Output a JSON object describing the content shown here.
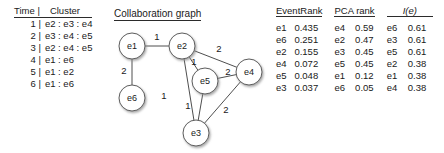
{
  "cluster_table": {
    "header_time": "Time |",
    "header_cluster": "Cluster",
    "rows": [
      {
        "time": "1 |",
        "members": "e2 : e3 : e4"
      },
      {
        "time": "2 |",
        "members": "e3 : e4 : e5"
      },
      {
        "time": "3 |",
        "members": "e2 : e4 : e5"
      },
      {
        "time": "4 |",
        "members": "e1 : e6"
      },
      {
        "time": "5 |",
        "members": "e1 : e2"
      },
      {
        "time": "6 |",
        "members": "e1 : e6"
      }
    ]
  },
  "graph": {
    "title": "Collaboration graph",
    "nodes": [
      {
        "id": "e1",
        "label": "e1",
        "x": 124,
        "y": 40,
        "r": 13
      },
      {
        "id": "e2",
        "label": "e2",
        "x": 174,
        "y": 40,
        "r": 13
      },
      {
        "id": "e6",
        "label": "e6",
        "x": 124,
        "y": 92,
        "r": 13
      },
      {
        "id": "e5",
        "label": "e5",
        "x": 197,
        "y": 75,
        "r": 13
      },
      {
        "id": "e4",
        "label": "e4",
        "x": 241,
        "y": 66,
        "r": 13
      },
      {
        "id": "e3",
        "label": "e3",
        "x": 188,
        "y": 127,
        "r": 13
      }
    ],
    "edges": [
      {
        "from": "e1",
        "to": "e2",
        "weight": "1",
        "lx": 149,
        "ly": 31
      },
      {
        "from": "e1",
        "to": "e6",
        "weight": "2",
        "lx": 116,
        "ly": 65
      },
      {
        "from": "e2",
        "to": "e4",
        "weight": "2",
        "lx": 211,
        "ly": 43
      },
      {
        "from": "e2",
        "to": "e5",
        "weight": "1",
        "lx": 186,
        "ly": 56
      },
      {
        "from": "e2",
        "to": "e3",
        "weight": "1",
        "lx": 156,
        "ly": 90
      },
      {
        "from": "e5",
        "to": "e4",
        "weight": "2",
        "lx": 220,
        "ly": 66
      },
      {
        "from": "e5",
        "to": "e3",
        "weight": "1",
        "lx": 180,
        "ly": 100
      },
      {
        "from": "e4",
        "to": "e3",
        "weight": "2",
        "lx": 218,
        "ly": 104
      }
    ]
  },
  "eventrank_table": {
    "caption": "EventRank",
    "rows": [
      {
        "entity": "e1",
        "value": "0.435"
      },
      {
        "entity": "e6",
        "value": "0.251"
      },
      {
        "entity": "e2",
        "value": "0.155"
      },
      {
        "entity": "e4",
        "value": "0.072"
      },
      {
        "entity": "e5",
        "value": "0.048"
      },
      {
        "entity": "e3",
        "value": "0.037"
      }
    ]
  },
  "pca_table": {
    "caption": "PCA rank",
    "rows": [
      {
        "entity": "e4",
        "value": "0.59"
      },
      {
        "entity": "e2",
        "value": "0.47"
      },
      {
        "entity": "e3",
        "value": "0.45"
      },
      {
        "entity": "e5",
        "value": "0.45"
      },
      {
        "entity": "e1",
        "value": "0.12"
      },
      {
        "entity": "e6",
        "value": "0.05"
      }
    ]
  },
  "ie_table": {
    "caption": "I(e)",
    "rows": [
      {
        "entity": "e6",
        "value": "0.61"
      },
      {
        "entity": "e3",
        "value": "0.61"
      },
      {
        "entity": "e5",
        "value": "0.61"
      },
      {
        "entity": "e2",
        "value": "0.38"
      },
      {
        "entity": "e1",
        "value": "0.38"
      },
      {
        "entity": "e4",
        "value": "0.38"
      }
    ]
  }
}
